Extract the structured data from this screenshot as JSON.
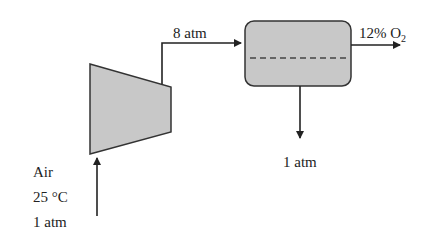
{
  "diagram": {
    "type": "process-flow",
    "colors": {
      "unit_fill": "#c8c8c8",
      "stroke": "#333333",
      "text": "#222222",
      "background": "#ffffff"
    },
    "units": {
      "compressor": {
        "label": "Compressor",
        "shape": "trapezoid"
      },
      "membrane": {
        "label": "Membrane separator",
        "shape": "rounded-rectangle-with-dashed-membrane"
      }
    },
    "streams": {
      "feed": {
        "lines": [
          "Air",
          "25 °C",
          "1 atm"
        ]
      },
      "compressed": {
        "label": "8 atm"
      },
      "retentate": {
        "label_prefix": "12% O",
        "label_subscript": "2"
      },
      "permeate": {
        "label": "1 atm"
      }
    }
  }
}
